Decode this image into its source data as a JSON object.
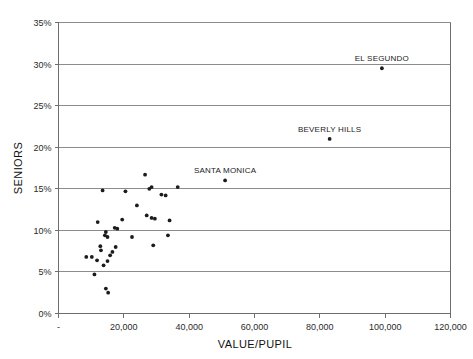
{
  "chart_data": {
    "type": "scatter",
    "title": "",
    "xlabel": "VALUE/PUPIL",
    "ylabel": "SENIORS",
    "xlim": [
      0,
      120000
    ],
    "ylim": [
      0,
      0.35
    ],
    "grid": "horizontal",
    "legend": "none",
    "x_ticks": [
      0,
      20000,
      40000,
      60000,
      80000,
      100000,
      120000
    ],
    "x_tick_labels": [
      "-",
      "20,000",
      "40,000",
      "60,000",
      "80,000",
      "100,000",
      "120,000"
    ],
    "y_ticks": [
      0,
      0.05,
      0.1,
      0.15,
      0.2,
      0.25,
      0.3,
      0.35
    ],
    "y_tick_labels": [
      "0%",
      "5%",
      "10%",
      "15%",
      "20%",
      "25%",
      "30%",
      "35%"
    ],
    "points": [
      {
        "x": 99000,
        "y": 0.295,
        "label": "EL SEGUNDO"
      },
      {
        "x": 83000,
        "y": 0.21,
        "label": "BEVERLY HILLS"
      },
      {
        "x": 51000,
        "y": 0.16,
        "label": "SANTA MONICA"
      },
      {
        "x": 26500,
        "y": 0.167,
        "label": ""
      },
      {
        "x": 36500,
        "y": 0.152,
        "label": ""
      },
      {
        "x": 28500,
        "y": 0.152,
        "label": ""
      },
      {
        "x": 27800,
        "y": 0.15,
        "label": ""
      },
      {
        "x": 13500,
        "y": 0.148,
        "label": ""
      },
      {
        "x": 20500,
        "y": 0.147,
        "label": ""
      },
      {
        "x": 31500,
        "y": 0.143,
        "label": ""
      },
      {
        "x": 32800,
        "y": 0.142,
        "label": ""
      },
      {
        "x": 24000,
        "y": 0.13,
        "label": ""
      },
      {
        "x": 27000,
        "y": 0.118,
        "label": ""
      },
      {
        "x": 28500,
        "y": 0.115,
        "label": ""
      },
      {
        "x": 29500,
        "y": 0.114,
        "label": ""
      },
      {
        "x": 19500,
        "y": 0.113,
        "label": ""
      },
      {
        "x": 34000,
        "y": 0.112,
        "label": ""
      },
      {
        "x": 12000,
        "y": 0.11,
        "label": ""
      },
      {
        "x": 17200,
        "y": 0.103,
        "label": ""
      },
      {
        "x": 18000,
        "y": 0.102,
        "label": ""
      },
      {
        "x": 14500,
        "y": 0.098,
        "label": ""
      },
      {
        "x": 14200,
        "y": 0.094,
        "label": ""
      },
      {
        "x": 15000,
        "y": 0.092,
        "label": ""
      },
      {
        "x": 33500,
        "y": 0.094,
        "label": ""
      },
      {
        "x": 22500,
        "y": 0.092,
        "label": ""
      },
      {
        "x": 29000,
        "y": 0.082,
        "label": ""
      },
      {
        "x": 12800,
        "y": 0.081,
        "label": ""
      },
      {
        "x": 17500,
        "y": 0.08,
        "label": ""
      },
      {
        "x": 13000,
        "y": 0.076,
        "label": ""
      },
      {
        "x": 16500,
        "y": 0.074,
        "label": ""
      },
      {
        "x": 15800,
        "y": 0.07,
        "label": ""
      },
      {
        "x": 8500,
        "y": 0.068,
        "label": ""
      },
      {
        "x": 10200,
        "y": 0.068,
        "label": ""
      },
      {
        "x": 11800,
        "y": 0.064,
        "label": ""
      },
      {
        "x": 15000,
        "y": 0.063,
        "label": ""
      },
      {
        "x": 13800,
        "y": 0.058,
        "label": ""
      },
      {
        "x": 11000,
        "y": 0.047,
        "label": ""
      },
      {
        "x": 14500,
        "y": 0.03,
        "label": ""
      },
      {
        "x": 15200,
        "y": 0.025,
        "label": ""
      }
    ]
  },
  "labels": {
    "el_segundo": "EL SEGUNDO",
    "beverly_hills": "BEVERLY HILLS",
    "santa_monica": "SANTA MONICA"
  },
  "colors": {
    "point": "#1c1c1c",
    "grid": "#8c8c8c",
    "frame": "#6e6e6e",
    "text": "#1a1a1a",
    "background": "#ffffff"
  }
}
